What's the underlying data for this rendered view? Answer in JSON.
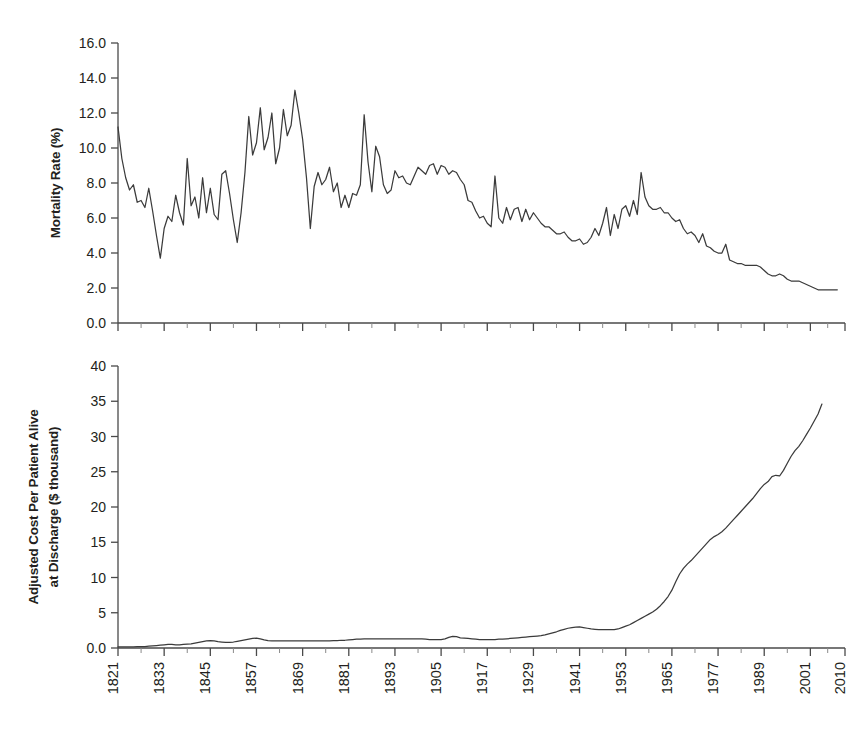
{
  "figure": {
    "background": "#ffffff",
    "line_color": "#3b3b3b",
    "axis_color": "#4a4a4a",
    "text_color": "#231f20"
  },
  "chart_data": [
    {
      "type": "line",
      "panel": "top",
      "title": "",
      "xlabel": "",
      "ylabel": "Mortality Rate (%)",
      "ylim": [
        0.0,
        16.0
      ],
      "yticks": [
        0.0,
        2.0,
        4.0,
        6.0,
        8.0,
        10.0,
        12.0,
        14.0,
        16.0
      ],
      "ytick_labels": [
        "0.0",
        "2.0",
        "4.0",
        "6.0",
        "8.0",
        "10.0",
        "12.0",
        "14.0",
        "16.0"
      ],
      "xlim": [
        1821,
        2010
      ],
      "xticks": [
        1821,
        1833,
        1845,
        1857,
        1869,
        1881,
        1893,
        1905,
        1917,
        1929,
        1941,
        1953,
        1965,
        1977,
        1989,
        2001,
        2010
      ],
      "xtick_labels": [
        "1821",
        "1833",
        "1845",
        "1857",
        "1869",
        "1881",
        "1893",
        "1905",
        "1917",
        "1929",
        "1941",
        "1953",
        "1965",
        "1977",
        "1989",
        "2001",
        "2010"
      ],
      "grid": false,
      "legend": "none",
      "series": [
        {
          "name": "Mortality Rate",
          "x": [
            1821,
            1822,
            1823,
            1824,
            1825,
            1826,
            1827,
            1828,
            1829,
            1830,
            1831,
            1832,
            1833,
            1834,
            1835,
            1836,
            1837,
            1838,
            1839,
            1840,
            1841,
            1842,
            1843,
            1844,
            1845,
            1846,
            1847,
            1848,
            1849,
            1850,
            1851,
            1852,
            1853,
            1854,
            1855,
            1856,
            1857,
            1858,
            1859,
            1860,
            1861,
            1862,
            1863,
            1864,
            1865,
            1866,
            1867,
            1868,
            1869,
            1870,
            1871,
            1872,
            1873,
            1874,
            1875,
            1876,
            1877,
            1878,
            1879,
            1880,
            1881,
            1882,
            1883,
            1884,
            1885,
            1886,
            1887,
            1888,
            1889,
            1890,
            1891,
            1892,
            1893,
            1894,
            1895,
            1896,
            1897,
            1898,
            1899,
            1900,
            1901,
            1902,
            1903,
            1904,
            1905,
            1906,
            1907,
            1908,
            1909,
            1910,
            1911,
            1912,
            1913,
            1914,
            1915,
            1916,
            1917,
            1918,
            1919,
            1920,
            1921,
            1922,
            1923,
            1924,
            1925,
            1926,
            1927,
            1928,
            1929,
            1930,
            1931,
            1932,
            1933,
            1934,
            1935,
            1936,
            1937,
            1938,
            1939,
            1940,
            1941,
            1942,
            1943,
            1944,
            1945,
            1946,
            1947,
            1948,
            1949,
            1950,
            1951,
            1952,
            1953,
            1954,
            1955,
            1956,
            1957,
            1958,
            1959,
            1960,
            1961,
            1962,
            1963,
            1964,
            1965,
            1966,
            1967,
            1968,
            1969,
            1970,
            1971,
            1972,
            1973,
            1974,
            1975,
            1976,
            1977,
            1978,
            1979,
            1980,
            1981,
            1982,
            1983,
            1984,
            1985,
            1986,
            1987,
            1988,
            1989,
            1990,
            1991,
            1992,
            1993,
            1994,
            1995,
            1996,
            1997,
            1998,
            1999,
            2000,
            2001,
            2002,
            2003,
            2004,
            2005,
            2006,
            2007,
            2008,
            2009,
            2010
          ],
          "values": [
            11.2,
            9.4,
            8.3,
            7.6,
            7.9,
            6.9,
            7.0,
            6.6,
            7.7,
            6.4,
            5.0,
            3.7,
            5.4,
            6.1,
            5.8,
            7.3,
            6.3,
            5.6,
            9.4,
            6.7,
            7.2,
            6.0,
            8.3,
            6.3,
            7.7,
            6.2,
            5.9,
            8.5,
            8.7,
            7.4,
            5.9,
            4.6,
            6.3,
            8.6,
            11.8,
            9.6,
            10.3,
            12.3,
            9.9,
            10.6,
            12.0,
            9.1,
            10.0,
            12.2,
            10.7,
            11.3,
            13.3,
            12.0,
            10.5,
            8.3,
            5.4,
            7.8,
            8.6,
            7.9,
            8.2,
            8.9,
            7.5,
            8.0,
            6.6,
            7.3,
            6.6,
            7.4,
            7.3,
            7.9,
            11.9,
            9.2,
            7.5,
            10.1,
            9.5,
            7.9,
            7.4,
            7.6,
            8.7,
            8.3,
            8.4,
            8.0,
            7.9,
            8.4,
            8.9,
            8.7,
            8.5,
            9.0,
            9.1,
            8.5,
            9.0,
            8.9,
            8.5,
            8.7,
            8.6,
            8.2,
            7.9,
            7.0,
            6.9,
            6.4,
            6.0,
            6.1,
            5.7,
            5.5,
            8.4,
            6.0,
            5.7,
            6.6,
            5.9,
            6.5,
            6.6,
            5.8,
            6.5,
            5.9,
            6.3,
            6.0,
            5.7,
            5.5,
            5.5,
            5.3,
            5.1,
            5.1,
            5.2,
            4.9,
            4.7,
            4.7,
            4.8,
            4.5,
            4.6,
            4.9,
            5.4,
            5.0,
            5.7,
            6.6,
            5.0,
            6.2,
            5.4,
            6.5,
            6.7,
            6.1,
            7.0,
            6.2,
            8.6,
            7.2,
            6.7,
            6.5,
            6.5,
            6.6,
            6.3,
            6.3,
            6.0,
            5.8,
            5.9,
            5.4,
            5.1,
            5.2,
            5.0,
            4.6,
            5.1,
            4.4,
            4.3,
            4.1,
            4.0,
            4.0,
            4.5,
            3.6,
            3.5,
            3.4,
            3.4,
            3.3,
            3.3,
            3.3,
            3.3,
            3.2,
            3.0,
            2.8,
            2.7,
            2.7,
            2.8,
            2.7,
            2.5,
            2.4,
            2.4,
            2.4,
            2.3,
            2.2,
            2.1,
            2.0,
            1.9,
            1.9,
            1.9,
            1.9,
            1.9,
            1.9
          ]
        }
      ]
    },
    {
      "type": "line",
      "panel": "bottom",
      "title": "",
      "xlabel": "",
      "ylabel": "Adjusted Cost Per Patient Alive at Discharge ($ thousand)",
      "ylabel_lines": [
        "Adjusted Cost Per Patient Alive",
        "at Discharge ($ thousand)"
      ],
      "ylim": [
        0,
        40
      ],
      "yticks": [
        0,
        5,
        10,
        15,
        20,
        25,
        30,
        35,
        40
      ],
      "ytick_labels": [
        "0.0",
        "5",
        "10",
        "15",
        "20",
        "25",
        "30",
        "35",
        "40"
      ],
      "xlim": [
        1821,
        2010
      ],
      "xticks": [
        1821,
        1833,
        1845,
        1857,
        1869,
        1881,
        1893,
        1905,
        1917,
        1929,
        1941,
        1953,
        1965,
        1977,
        1989,
        2001,
        2010
      ],
      "xtick_labels": [
        "1821",
        "1833",
        "1845",
        "1857",
        "1869",
        "1881",
        "1893",
        "1905",
        "1917",
        "1929",
        "1941",
        "1953",
        "1965",
        "1977",
        "1989",
        "2001",
        "2010"
      ],
      "grid": false,
      "legend": "none",
      "series": [
        {
          "name": "Adjusted Cost Per Patient Alive at Discharge",
          "x": [
            1821,
            1822,
            1823,
            1824,
            1825,
            1826,
            1827,
            1828,
            1829,
            1830,
            1831,
            1832,
            1833,
            1834,
            1835,
            1836,
            1837,
            1838,
            1839,
            1840,
            1841,
            1842,
            1843,
            1844,
            1845,
            1846,
            1847,
            1848,
            1849,
            1850,
            1851,
            1852,
            1853,
            1854,
            1855,
            1856,
            1857,
            1858,
            1859,
            1860,
            1861,
            1862,
            1863,
            1864,
            1865,
            1866,
            1867,
            1868,
            1869,
            1870,
            1871,
            1872,
            1873,
            1874,
            1875,
            1876,
            1877,
            1878,
            1879,
            1880,
            1881,
            1882,
            1883,
            1884,
            1885,
            1886,
            1887,
            1888,
            1889,
            1890,
            1891,
            1892,
            1893,
            1894,
            1895,
            1896,
            1897,
            1898,
            1899,
            1900,
            1901,
            1902,
            1903,
            1904,
            1905,
            1906,
            1907,
            1908,
            1909,
            1910,
            1911,
            1912,
            1913,
            1914,
            1915,
            1916,
            1917,
            1918,
            1919,
            1920,
            1921,
            1922,
            1923,
            1924,
            1925,
            1926,
            1927,
            1928,
            1929,
            1930,
            1931,
            1932,
            1933,
            1934,
            1935,
            1936,
            1937,
            1938,
            1939,
            1940,
            1941,
            1942,
            1943,
            1944,
            1945,
            1946,
            1947,
            1948,
            1949,
            1950,
            1951,
            1952,
            1953,
            1954,
            1955,
            1956,
            1957,
            1958,
            1959,
            1960,
            1961,
            1962,
            1963,
            1964,
            1965,
            1966,
            1967,
            1968,
            1969,
            1970,
            1971,
            1972,
            1973,
            1974,
            1975,
            1976,
            1977,
            1978,
            1979,
            1980,
            1981,
            1982,
            1983,
            1984,
            1985,
            1986,
            1987,
            1988,
            1989,
            1990,
            1991,
            1992,
            1993,
            1994,
            1995,
            1996,
            1997,
            1998,
            1999,
            2000,
            2001,
            2002,
            2003,
            2004,
            2005,
            2006,
            2007,
            2008,
            2009,
            2010
          ],
          "values": [
            0.15,
            0.15,
            0.15,
            0.15,
            0.15,
            0.2,
            0.2,
            0.2,
            0.25,
            0.3,
            0.35,
            0.4,
            0.45,
            0.5,
            0.5,
            0.45,
            0.45,
            0.5,
            0.55,
            0.6,
            0.7,
            0.8,
            0.9,
            1.0,
            1.05,
            1.0,
            0.9,
            0.85,
            0.8,
            0.8,
            0.85,
            0.95,
            1.05,
            1.15,
            1.25,
            1.35,
            1.4,
            1.3,
            1.15,
            1.05,
            1.0,
            1.0,
            1.0,
            1.0,
            1.0,
            1.0,
            1.0,
            1.0,
            1.0,
            1.0,
            1.0,
            1.0,
            1.0,
            1.0,
            1.0,
            1.0,
            1.05,
            1.05,
            1.1,
            1.1,
            1.15,
            1.2,
            1.25,
            1.25,
            1.3,
            1.3,
            1.3,
            1.3,
            1.3,
            1.3,
            1.3,
            1.3,
            1.3,
            1.3,
            1.3,
            1.3,
            1.3,
            1.3,
            1.3,
            1.3,
            1.25,
            1.2,
            1.2,
            1.2,
            1.2,
            1.3,
            1.5,
            1.65,
            1.6,
            1.45,
            1.4,
            1.35,
            1.3,
            1.25,
            1.2,
            1.2,
            1.2,
            1.2,
            1.2,
            1.25,
            1.25,
            1.3,
            1.35,
            1.4,
            1.45,
            1.5,
            1.55,
            1.6,
            1.65,
            1.7,
            1.75,
            1.85,
            2.0,
            2.15,
            2.3,
            2.5,
            2.65,
            2.8,
            2.9,
            2.95,
            3.0,
            2.9,
            2.8,
            2.7,
            2.65,
            2.6,
            2.6,
            2.6,
            2.6,
            2.6,
            2.7,
            2.9,
            3.1,
            3.3,
            3.6,
            3.9,
            4.2,
            4.5,
            4.8,
            5.1,
            5.5,
            6.0,
            6.6,
            7.3,
            8.2,
            9.4,
            10.5,
            11.3,
            11.9,
            12.4,
            13.0,
            13.6,
            14.2,
            14.8,
            15.4,
            15.8,
            16.1,
            16.5,
            17.0,
            17.6,
            18.2,
            18.8,
            19.4,
            20.0,
            20.6,
            21.2,
            21.9,
            22.6,
            23.2,
            23.6,
            24.3,
            24.5,
            24.4,
            25.2,
            26.2,
            27.2,
            28.0,
            28.6,
            29.4,
            30.3,
            31.2,
            32.2,
            33.2,
            34.6
          ]
        }
      ]
    }
  ]
}
